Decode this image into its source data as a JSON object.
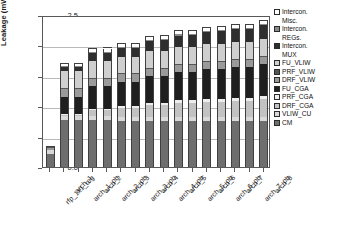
{
  "chart_data": {
    "type": "bar",
    "title": "",
    "xlabel": "",
    "ylabel": "Leakage (mW)",
    "ylim": [
      0.0,
      2.5
    ],
    "yticks": [
      "0.0",
      "0.5",
      "1.0",
      "1.5",
      "2.0",
      "2.5"
    ],
    "grid": true,
    "stacked": true,
    "legend_position": "right",
    "categories": [
      "rfp_1x1_reg",
      "arch_1",
      "arch_1_pb",
      "arch_2",
      "arch_2_pb",
      "arch_3",
      "arch_3_pb",
      "arch_4",
      "arch_4_pb",
      "arch_5",
      "arch_5_pb",
      "arch_6",
      "arch_6_pb",
      "arch_7",
      "arch_7_pb",
      "arch_8"
    ],
    "series": [
      {
        "name": "CM",
        "color": "#6e6e6e",
        "values": [
          0.22,
          0.78,
          0.78,
          0.78,
          0.78,
          0.78,
          0.78,
          0.78,
          0.78,
          0.78,
          0.78,
          0.78,
          0.78,
          0.78,
          0.78,
          0.78
        ]
      },
      {
        "name": "VLIW_CU",
        "color": "#d9d9d9",
        "values": [
          0.07,
          0.06,
          0.06,
          0.06,
          0.06,
          0.06,
          0.06,
          0.06,
          0.06,
          0.06,
          0.06,
          0.06,
          0.06,
          0.06,
          0.06,
          0.06
        ]
      },
      {
        "name": "DRF_CGA",
        "color": "#c2c2c2",
        "values": [
          0.0,
          0.02,
          0.02,
          0.09,
          0.09,
          0.15,
          0.15,
          0.2,
          0.2,
          0.24,
          0.24,
          0.26,
          0.26,
          0.28,
          0.28,
          0.3
        ]
      },
      {
        "name": "PRF_CGA",
        "color": "#ededed",
        "values": [
          0.0,
          0.02,
          0.02,
          0.03,
          0.03,
          0.03,
          0.03,
          0.04,
          0.04,
          0.04,
          0.04,
          0.05,
          0.05,
          0.05,
          0.05,
          0.05
        ]
      },
      {
        "name": "FU_CGA",
        "color": "#1f1f1f",
        "values": [
          0.0,
          0.28,
          0.28,
          0.37,
          0.37,
          0.42,
          0.42,
          0.45,
          0.45,
          0.48,
          0.48,
          0.5,
          0.5,
          0.52,
          0.52,
          0.54
        ]
      },
      {
        "name": "DRF_VLIW",
        "color": "#9a9a9a",
        "values": [
          0.03,
          0.12,
          0.12,
          0.12,
          0.12,
          0.12,
          0.12,
          0.12,
          0.12,
          0.12,
          0.12,
          0.12,
          0.12,
          0.12,
          0.12,
          0.12
        ]
      },
      {
        "name": "PRF_VLIW",
        "color": "#555555",
        "values": [
          0.01,
          0.02,
          0.02,
          0.02,
          0.02,
          0.02,
          0.02,
          0.02,
          0.02,
          0.02,
          0.02,
          0.02,
          0.02,
          0.02,
          0.02,
          0.02
        ]
      },
      {
        "name": "FU_VLIW",
        "color": "#cfcfcf",
        "values": [
          0.0,
          0.28,
          0.28,
          0.28,
          0.28,
          0.28,
          0.28,
          0.28,
          0.28,
          0.28,
          0.28,
          0.28,
          0.28,
          0.28,
          0.28,
          0.28
        ]
      },
      {
        "name": "Intercon. MUX",
        "color": "#2e2e2e",
        "values": [
          0.0,
          0.07,
          0.07,
          0.12,
          0.13,
          0.14,
          0.15,
          0.17,
          0.18,
          0.19,
          0.2,
          0.2,
          0.21,
          0.22,
          0.22,
          0.23
        ]
      },
      {
        "name": "Intercon. REGs.",
        "color": "#8a8a8a",
        "values": [
          0.0,
          0.01,
          0.01,
          0.02,
          0.02,
          0.02,
          0.02,
          0.02,
          0.02,
          0.02,
          0.02,
          0.02,
          0.02,
          0.02,
          0.02,
          0.02
        ]
      },
      {
        "name": "Intercon. Misc.",
        "color": "#ffffff",
        "values": [
          0.0,
          0.04,
          0.04,
          0.05,
          0.05,
          0.05,
          0.05,
          0.05,
          0.05,
          0.05,
          0.05,
          0.05,
          0.05,
          0.05,
          0.05,
          0.05
        ]
      }
    ],
    "totals": [
      0.33,
      1.7,
      1.7,
      1.94,
      1.95,
      2.02,
      2.03,
      2.14,
      2.15,
      2.23,
      2.24,
      2.29,
      2.3,
      2.34,
      2.34,
      2.4
    ]
  },
  "legend": {
    "items": [
      {
        "line1": "Intercon.",
        "line2": "Misc.",
        "color": "#ffffff"
      },
      {
        "line1": "Intercon.",
        "line2": "REGs.",
        "color": "#8a8a8a"
      },
      {
        "line1": "Intercon.",
        "line2": "MUX",
        "color": "#2e2e2e"
      },
      {
        "line1": "FU_VLIW",
        "line2": "",
        "color": "#cfcfcf"
      },
      {
        "line1": "PRF_VLIW",
        "line2": "",
        "color": "#555555"
      },
      {
        "line1": "DRF_VLIW",
        "line2": "",
        "color": "#9a9a9a"
      },
      {
        "line1": "FU_CGA",
        "line2": "",
        "color": "#1f1f1f"
      },
      {
        "line1": "PRF_CGA",
        "line2": "",
        "color": "#ededed"
      },
      {
        "line1": "DRF_CGA",
        "line2": "",
        "color": "#c2c2c2"
      },
      {
        "line1": "VLIW_CU",
        "line2": "",
        "color": "#d9d9d9"
      },
      {
        "line1": "CM",
        "line2": "",
        "color": "#6e6e6e"
      }
    ]
  }
}
